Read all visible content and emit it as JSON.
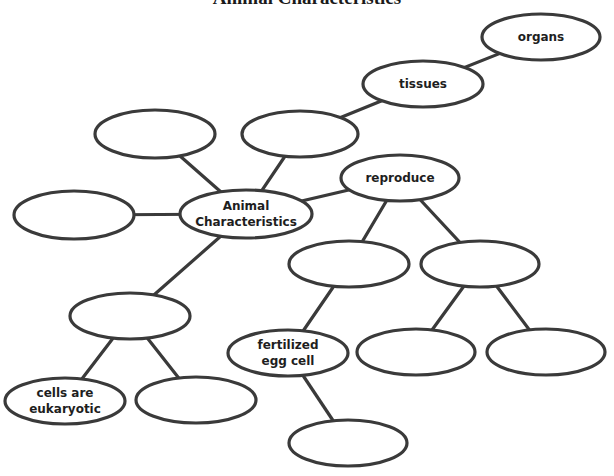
{
  "title": "Animal Characteristics",
  "colors": {
    "stroke": "#3a3a3a",
    "text": "#1e1e1e",
    "background": "#ffffff"
  },
  "nodes": [
    {
      "id": "center",
      "label": "Animal\nCharacteristics",
      "cx": 246,
      "cy": 214,
      "rx": 66,
      "ry": 24
    },
    {
      "id": "tl",
      "label": "",
      "cx": 155,
      "cy": 134,
      "rx": 60,
      "ry": 24
    },
    {
      "id": "tm",
      "label": "",
      "cx": 300,
      "cy": 134,
      "rx": 58,
      "ry": 23
    },
    {
      "id": "left",
      "label": "",
      "cx": 74,
      "cy": 215,
      "rx": 60,
      "ry": 24
    },
    {
      "id": "tissues",
      "label": "tissues",
      "cx": 423,
      "cy": 84,
      "rx": 60,
      "ry": 23
    },
    {
      "id": "organs",
      "label": "organs",
      "cx": 541,
      "cy": 37,
      "rx": 59,
      "ry": 23
    },
    {
      "id": "reproduce",
      "label": "reproduce",
      "cx": 400,
      "cy": 178,
      "rx": 59,
      "ry": 23
    },
    {
      "id": "r_left",
      "label": "",
      "cx": 349,
      "cy": 264,
      "rx": 60,
      "ry": 23
    },
    {
      "id": "r_right",
      "label": "",
      "cx": 480,
      "cy": 264,
      "rx": 59,
      "ry": 23
    },
    {
      "id": "mid_left",
      "label": "",
      "cx": 130,
      "cy": 316,
      "rx": 60,
      "ry": 23
    },
    {
      "id": "eukaryotic",
      "label": "cells are\neukaryotic",
      "cx": 65,
      "cy": 401,
      "rx": 60,
      "ry": 23
    },
    {
      "id": "bl2",
      "label": "",
      "cx": 196,
      "cy": 400,
      "rx": 60,
      "ry": 23
    },
    {
      "id": "fertilized",
      "label": "fertilized\negg cell",
      "cx": 288,
      "cy": 353,
      "rx": 60,
      "ry": 23
    },
    {
      "id": "rr_left",
      "label": "",
      "cx": 416,
      "cy": 352,
      "rx": 59,
      "ry": 23
    },
    {
      "id": "rr_right",
      "label": "",
      "cx": 546,
      "cy": 352,
      "rx": 59,
      "ry": 23
    },
    {
      "id": "bottom",
      "label": "",
      "cx": 348,
      "cy": 443,
      "rx": 59,
      "ry": 23
    }
  ],
  "edges": [
    [
      "center",
      "tl"
    ],
    [
      "center",
      "tm"
    ],
    [
      "center",
      "left"
    ],
    [
      "center",
      "reproduce"
    ],
    [
      "center",
      "mid_left"
    ],
    [
      "tm",
      "tissues"
    ],
    [
      "tissues",
      "organs"
    ],
    [
      "reproduce",
      "r_left"
    ],
    [
      "reproduce",
      "r_right"
    ],
    [
      "r_left",
      "fertilized"
    ],
    [
      "r_right",
      "rr_left"
    ],
    [
      "r_right",
      "rr_right"
    ],
    [
      "fertilized",
      "bottom"
    ],
    [
      "mid_left",
      "eukaryotic"
    ],
    [
      "mid_left",
      "bl2"
    ]
  ]
}
